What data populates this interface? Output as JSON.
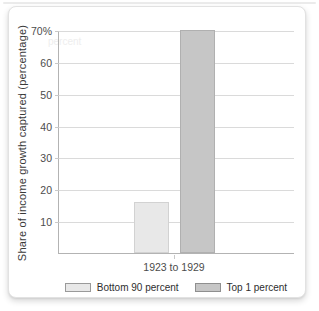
{
  "page": {
    "background": "#ffffff",
    "top_line_color": "#ebebeb"
  },
  "card": {
    "background": "#ffffff",
    "border_color": "#e2e2e2"
  },
  "chart_data": {
    "type": "bar",
    "title": "",
    "xlabel": "",
    "ylabel": "Share of income growth captured (percentage)",
    "categories": [
      "1923 to 1929"
    ],
    "series": [
      {
        "name": "Bottom 90 percent",
        "values": [
          16
        ],
        "fill": "#e8e8e8",
        "border": "#d2d2d2"
      },
      {
        "name": "Top 1 percent",
        "values": [
          70
        ],
        "fill": "#c6c6c6",
        "border": "#b0b0b0"
      }
    ],
    "ylim": [
      0,
      70
    ],
    "yticks": [
      {
        "value": 70,
        "label": "70%"
      },
      {
        "value": 60,
        "label": "60"
      },
      {
        "value": 50,
        "label": "50"
      },
      {
        "value": 40,
        "label": "40"
      },
      {
        "value": 30,
        "label": "30"
      },
      {
        "value": 20,
        "label": "20"
      },
      {
        "value": 10,
        "label": "10"
      }
    ],
    "grid": true,
    "legend_position": "bottom",
    "watermark": "percent"
  },
  "colors": {
    "gridline": "#dadada",
    "axis": "#b3b3b3",
    "tick_mark": "#c9c9c9",
    "tick_text": "#4c4c4c",
    "axis_label_text": "#3a3a3a",
    "legend_text": "#2e2e2e",
    "legend_swatch_border_light": "#9a9a9a",
    "legend_swatch_border_dark": "#8f8f8f",
    "watermark": "#eeeeee"
  }
}
